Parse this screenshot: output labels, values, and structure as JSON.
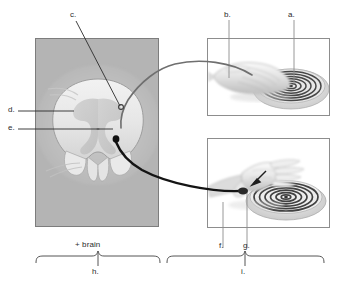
{
  "figure": {
    "type": "anatomical-diagram",
    "top_cut_text": "",
    "labels": [
      {
        "key": "a",
        "text": "a.",
        "x": 291,
        "y": 14,
        "leader": "vertical-down"
      },
      {
        "key": "b",
        "text": "b.",
        "x": 226,
        "y": 14,
        "leader": "vertical-down"
      },
      {
        "key": "c",
        "text": "c.",
        "x": 71,
        "y": 15,
        "leader": "diagonal-down-right"
      },
      {
        "key": "d",
        "text": "d.",
        "x": 8,
        "y": 108,
        "leader": "horizontal-right"
      },
      {
        "key": "e",
        "text": "e.",
        "x": 8,
        "y": 126,
        "leader": "horizontal-right"
      },
      {
        "key": "f",
        "text": "f.",
        "x": 220,
        "y": 246,
        "leader": "vertical-up"
      },
      {
        "key": "g",
        "text": "g.",
        "x": 244,
        "y": 246,
        "leader": "vertical-up"
      },
      {
        "key": "h",
        "text": "h.",
        "x": 91,
        "y": 274,
        "leader": "brace-below"
      },
      {
        "key": "i",
        "text": "i.",
        "x": 242,
        "y": 274,
        "leader": "brace-below"
      }
    ],
    "braces": [
      {
        "name": "left-brace",
        "caption_above": "+ brain",
        "caption_below": "h."
      },
      {
        "name": "right-brace",
        "caption_above": "",
        "caption_below": "i."
      }
    ],
    "caption_plus_brain": "+ brain",
    "panels": [
      {
        "name": "spinal-cord-panel",
        "content": "spinal cord cross-section photomicrograph"
      },
      {
        "name": "hand-top-panel",
        "content": "hand resting on hot coil burner"
      },
      {
        "name": "hand-bottom-panel",
        "content": "hand withdrawn above hot coil burner"
      }
    ],
    "pathways": [
      {
        "name": "sensory-afferent",
        "style": "thin gray",
        "from": "hand-top-panel",
        "to": "spinal-cord-panel"
      },
      {
        "name": "motor-efferent",
        "style": "thick black",
        "from": "spinal-cord-panel",
        "to": "hand-bottom-panel"
      }
    ],
    "colors": {
      "panel_border": "#8d8d8d",
      "cord_background": "#b4b4b4",
      "gray_matter": "#c9c9c9",
      "white_matter": "#ececec",
      "afferent": "#6f6f6f",
      "efferent": "#141414",
      "text": "#2b2b2b",
      "brace": "#555555"
    }
  }
}
